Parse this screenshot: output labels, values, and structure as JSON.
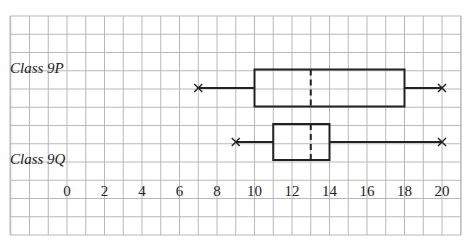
{
  "chart_data": {
    "type": "boxplot",
    "title": "",
    "xlabel": "",
    "ylabel": "",
    "xlim": [
      -3,
      21
    ],
    "x_ticks": [
      0,
      2,
      4,
      6,
      8,
      10,
      12,
      14,
      16,
      18,
      20
    ],
    "grid": true,
    "series": [
      {
        "name": "Class 9P",
        "min": 7,
        "q1": 10,
        "median": 13,
        "q3": 18,
        "max": 20
      },
      {
        "name": "Class 9Q",
        "min": 9,
        "q1": 11,
        "median": 13,
        "q3": 14,
        "max": 20
      }
    ],
    "median_style": "dashed",
    "whisker_end_marker": "x"
  },
  "labels": {
    "class_9p": "Class 9P",
    "class_9q": "Class 9Q"
  },
  "colors": {
    "grid": "#b8b8b8",
    "ink": "#222222"
  }
}
